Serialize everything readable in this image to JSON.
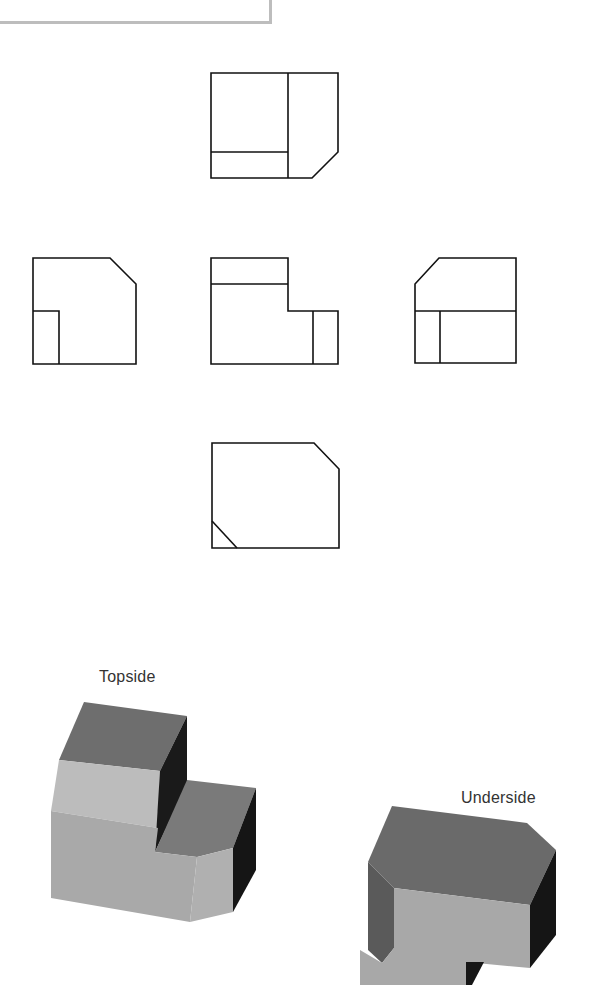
{
  "diagram": {
    "type": "orthographic-multiview-with-isometric",
    "frame_fragment": {
      "visible": true,
      "border_color": "#bdbdbd"
    },
    "orthographic_views": [
      {
        "id": "top",
        "position": "top-center",
        "description": "Square with a vertical division at right, horizontal strip at bottom-left, chamfered bottom-right corner"
      },
      {
        "id": "left",
        "position": "middle-left",
        "description": "Square with chamfered top-right corner and small rectangle at bottom-left"
      },
      {
        "id": "front",
        "position": "middle-center",
        "description": "L-shaped profile: tall left block with top strip, lower right step divided by a vertical line"
      },
      {
        "id": "right",
        "position": "middle-right",
        "description": "Square with chamfered top-left corner, horizontal division, and small rectangle at bottom-left"
      },
      {
        "id": "bottom",
        "position": "bottom-center",
        "description": "Square with chamfered top-right corner and small diagonal at bottom-left"
      }
    ],
    "line_color": "#111111",
    "isometric_views": [
      {
        "label": "Topside",
        "faces": {
          "top_dark": "#6e6e6e",
          "front_light": "#bcbcbc",
          "front_mid": "#a9a9a9",
          "side_black": "#1a1a1a",
          "step_top": "#7a7a7a"
        }
      },
      {
        "label": "Underside",
        "faces": {
          "top_dark": "#6a6a6a",
          "left_mid": "#5a5a5a",
          "front_light": "#a8a8a8",
          "side_black": "#151515"
        }
      }
    ]
  }
}
